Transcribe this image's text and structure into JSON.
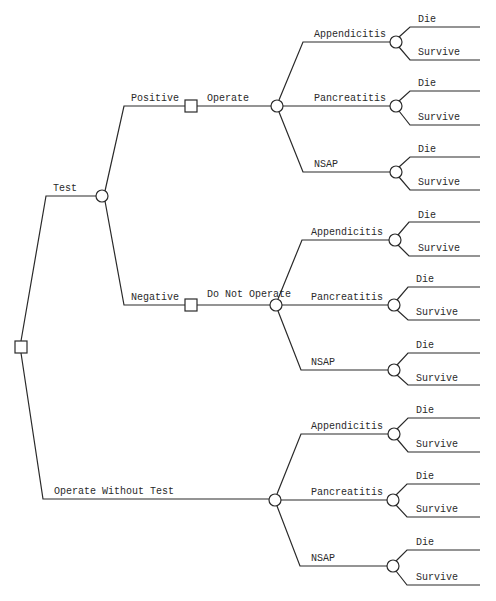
{
  "diagram": {
    "type": "decision-tree",
    "root": {
      "kind": "decision"
    },
    "labels": {
      "test": "Test",
      "positive": "Positive",
      "negative": "Negative",
      "operate": "Operate",
      "do_not_operate": "Do Not Operate",
      "operate_without_test": "Operate Without Test"
    },
    "groups": [
      {
        "id": "positive-operate",
        "diagnoses": [
          {
            "label": "Appendicitis",
            "outcomes": [
              "Die",
              "Survive"
            ]
          },
          {
            "label": "Pancreatitis",
            "outcomes": [
              "Die",
              "Survive"
            ]
          },
          {
            "label": "NSAP",
            "outcomes": [
              "Die",
              "Survive"
            ]
          }
        ]
      },
      {
        "id": "negative-do-not-operate",
        "diagnoses": [
          {
            "label": "Appendicitis",
            "outcomes": [
              "Die",
              "Survive"
            ]
          },
          {
            "label": "Pancreatitis",
            "outcomes": [
              "Die",
              "Survive"
            ]
          },
          {
            "label": "NSAP",
            "outcomes": [
              "Die",
              "Survive"
            ]
          }
        ]
      },
      {
        "id": "operate-without-test",
        "diagnoses": [
          {
            "label": "Appendicitis",
            "outcomes": [
              "Die",
              "Survive"
            ]
          },
          {
            "label": "Pancreatitis",
            "outcomes": [
              "Die",
              "Survive"
            ]
          },
          {
            "label": "NSAP",
            "outcomes": [
              "Die",
              "Survive"
            ]
          }
        ]
      }
    ]
  }
}
